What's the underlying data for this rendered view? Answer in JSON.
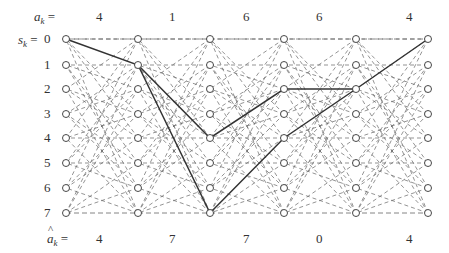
{
  "diagram": {
    "type": "trellis",
    "top_label": {
      "symbol": "a",
      "subscript": "k",
      "suffix": " ="
    },
    "state_label": {
      "symbol": "s",
      "subscript": "k",
      "suffix": " ="
    },
    "bottom_label": {
      "symbol": "a",
      "subscript": "k",
      "suffix": " =",
      "hat": "^"
    },
    "states": [
      "0",
      "1",
      "2",
      "3",
      "4",
      "5",
      "6",
      "7"
    ],
    "top_values": [
      "4",
      "1",
      "6",
      "6",
      "4"
    ],
    "bottom_values": [
      "4",
      "7",
      "7",
      "0",
      "4"
    ],
    "columns": 6,
    "survivor_paths": [
      {
        "name": "decoded-path",
        "states_by_column": [
          0,
          1,
          7,
          4,
          2,
          0
        ]
      },
      {
        "name": "alternate-path",
        "states_by_column": [
          null,
          1,
          4,
          2,
          2,
          null
        ]
      }
    ],
    "colors": {
      "line": "#333333",
      "dashed": "#666666",
      "node_fill": "#ffffff"
    }
  }
}
